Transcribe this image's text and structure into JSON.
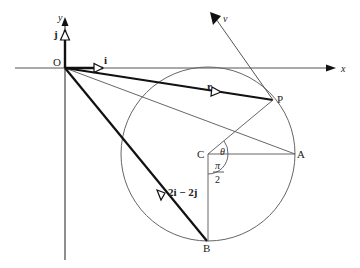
{
  "diagram": {
    "axes": {
      "x_label": "x",
      "y_label": "y",
      "origin_label": "O"
    },
    "vectors": {
      "i_label": "i",
      "j_label": "j",
      "r_label": "r",
      "b_label": "2i − 2j",
      "v_label": "v"
    },
    "points": {
      "P": "P",
      "A": "A",
      "B": "B",
      "C": "C"
    },
    "angles": {
      "theta": "θ",
      "pi": "π",
      "two": "2"
    },
    "colors": {
      "line": "#222222",
      "thin": "#666666"
    }
  }
}
